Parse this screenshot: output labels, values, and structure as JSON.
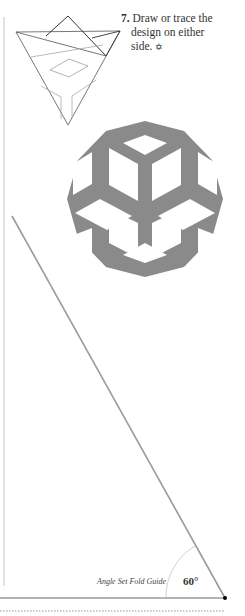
{
  "step": {
    "number": "7.",
    "line1": "Draw or trace the",
    "line2": "design on either",
    "line3": "side.",
    "ornament": "✡"
  },
  "guide": {
    "label": "Angle Set Fold Guide",
    "angle": "60°"
  },
  "colors": {
    "design_fill": "#8a8a8a",
    "guide_line": "#9a9a9a",
    "dot": "#000000"
  }
}
